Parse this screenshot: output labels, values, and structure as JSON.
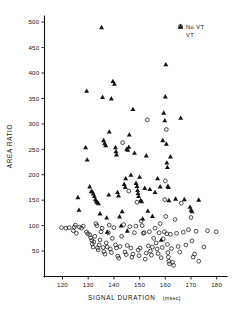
{
  "chart_data": {
    "type": "scatter",
    "title": "",
    "xlabel": "SIGNAL DURATION (msec)",
    "xlabel_main": "SIGNAL DURATION",
    "xlabel_unit": "(msec)",
    "ylabel": "AREA RATIO",
    "xlim": [
      113,
      184
    ],
    "ylim": [
      0,
      512
    ],
    "xticks": [
      120,
      130,
      140,
      150,
      160,
      170,
      180
    ],
    "yticks": [
      50,
      100,
      150,
      200,
      250,
      300,
      350,
      400,
      450,
      500
    ],
    "grid": false,
    "legend_position": "top-right",
    "colors": {
      "marker": "#141414",
      "axis": "#101010",
      "background": "#ffffff"
    },
    "series": [
      {
        "name": "No VT",
        "marker": "open-circle",
        "points": [
          [
            119.6,
            96
          ],
          [
            121.3,
            95
          ],
          [
            122.6,
            96
          ],
          [
            124.2,
            90
          ],
          [
            124.6,
            97
          ],
          [
            125.0,
            101
          ],
          [
            125.4,
            85
          ],
          [
            126.6,
            97
          ],
          [
            127.4,
            95
          ],
          [
            128.1,
            99
          ],
          [
            129.3,
            88
          ],
          [
            129.8,
            84
          ],
          [
            130.6,
            82
          ],
          [
            131.0,
            76
          ],
          [
            131.4,
            71
          ],
          [
            131.6,
            64
          ],
          [
            131.9,
            58
          ],
          [
            132.2,
            68
          ],
          [
            132.6,
            79
          ],
          [
            133.0,
            104
          ],
          [
            133.4,
            100
          ],
          [
            133.6,
            56
          ],
          [
            133.9,
            52
          ],
          [
            134.3,
            62
          ],
          [
            134.6,
            72
          ],
          [
            135.0,
            88
          ],
          [
            135.4,
            95
          ],
          [
            135.8,
            57
          ],
          [
            136.1,
            49
          ],
          [
            136.5,
            44
          ],
          [
            137.0,
            66
          ],
          [
            137.4,
            58
          ],
          [
            137.8,
            86
          ],
          [
            138.2,
            101
          ],
          [
            138.6,
            54
          ],
          [
            139.0,
            47
          ],
          [
            139.4,
            75
          ],
          [
            140.0,
            96
          ],
          [
            140.6,
            62
          ],
          [
            141.0,
            56
          ],
          [
            141.5,
            40
          ],
          [
            141.9,
            36
          ],
          [
            142.4,
            59
          ],
          [
            143.0,
            79
          ],
          [
            143.4,
            263
          ],
          [
            143.8,
            102
          ],
          [
            144.3,
            48
          ],
          [
            144.8,
            43
          ],
          [
            145.2,
            61
          ],
          [
            145.8,
            168
          ],
          [
            146.2,
            98
          ],
          [
            146.6,
            56
          ],
          [
            147.0,
            38
          ],
          [
            147.4,
            44
          ],
          [
            148.0,
            86
          ],
          [
            148.5,
            99
          ],
          [
            149.0,
            146
          ],
          [
            149.4,
            52
          ],
          [
            149.8,
            41
          ],
          [
            150.2,
            56
          ],
          [
            150.6,
            109
          ],
          [
            151.0,
            100
          ],
          [
            151.4,
            85
          ],
          [
            151.8,
            86
          ],
          [
            152.2,
            34
          ],
          [
            152.6,
            46
          ],
          [
            153.0,
            308
          ],
          [
            153.4,
            60
          ],
          [
            153.8,
            88
          ],
          [
            154.2,
            50
          ],
          [
            154.6,
            42
          ],
          [
            155.0,
            58
          ],
          [
            155.5,
            75
          ],
          [
            156.0,
            95
          ],
          [
            156.4,
            66
          ],
          [
            156.8,
            54
          ],
          [
            157.2,
            45
          ],
          [
            157.6,
            86
          ],
          [
            158.0,
            104
          ],
          [
            158.4,
            37
          ],
          [
            158.8,
            57
          ],
          [
            159.2,
            74
          ],
          [
            159.6,
            88
          ],
          [
            159.8,
            151
          ],
          [
            160.0,
            188
          ],
          [
            160.2,
            118
          ],
          [
            160.4,
            289
          ],
          [
            160.6,
            84
          ],
          [
            160.8,
            63
          ],
          [
            161.0,
            47
          ],
          [
            161.2,
            38
          ],
          [
            161.4,
            30
          ],
          [
            161.6,
            25
          ],
          [
            162.0,
            83
          ],
          [
            162.4,
            55
          ],
          [
            162.8,
            28
          ],
          [
            163.2,
            22
          ],
          [
            163.8,
            112
          ],
          [
            164.4,
            85
          ],
          [
            165.0,
            59
          ],
          [
            165.6,
            48
          ],
          [
            166.2,
            144
          ],
          [
            167.0,
            87
          ],
          [
            168.0,
            62
          ],
          [
            169.0,
            92
          ],
          [
            170.0,
            116
          ],
          [
            170.4,
            70
          ],
          [
            170.8,
            38
          ],
          [
            171.4,
            44
          ],
          [
            172.0,
            89
          ],
          [
            173.0,
            30
          ],
          [
            175.0,
            58
          ],
          [
            176.4,
            90
          ],
          [
            179.8,
            88
          ]
        ]
      },
      {
        "name": "VT",
        "marker": "filled-triangle",
        "points": [
          [
            126.0,
            156
          ],
          [
            126.4,
            131
          ],
          [
            129.4,
            365
          ],
          [
            129.0,
            254
          ],
          [
            129.6,
            230
          ],
          [
            130.6,
            177
          ],
          [
            131.2,
            168
          ],
          [
            131.6,
            167
          ],
          [
            132.0,
            163
          ],
          [
            132.4,
            158
          ],
          [
            132.8,
            152
          ],
          [
            133.2,
            148
          ],
          [
            133.6,
            146
          ],
          [
            134.0,
            144
          ],
          [
            134.6,
            124
          ],
          [
            135.2,
            490
          ],
          [
            135.6,
            353
          ],
          [
            136.0,
            268
          ],
          [
            136.4,
            262
          ],
          [
            136.8,
            258
          ],
          [
            137.2,
            116
          ],
          [
            138.0,
            161
          ],
          [
            138.2,
            285
          ],
          [
            139.0,
            350
          ],
          [
            139.6,
            384
          ],
          [
            140.2,
            379
          ],
          [
            140.6,
            254
          ],
          [
            140.8,
            246
          ],
          [
            141.0,
            240
          ],
          [
            141.4,
            166
          ],
          [
            141.8,
            159
          ],
          [
            142.2,
            118
          ],
          [
            142.8,
            100
          ],
          [
            143.2,
            128
          ],
          [
            144.0,
            182
          ],
          [
            144.4,
            176
          ],
          [
            144.6,
            193
          ],
          [
            145.0,
            251
          ],
          [
            145.4,
            249
          ],
          [
            145.8,
            255
          ],
          [
            146.0,
            279
          ],
          [
            146.6,
            200
          ],
          [
            147.4,
            329
          ],
          [
            148.0,
            243
          ],
          [
            148.6,
            184
          ],
          [
            149.0,
            178
          ],
          [
            149.2,
            170
          ],
          [
            149.4,
            164
          ],
          [
            149.6,
            158
          ],
          [
            150.0,
            196
          ],
          [
            150.4,
            150
          ],
          [
            150.8,
            148
          ],
          [
            151.2,
            114
          ],
          [
            152.0,
            174
          ],
          [
            152.6,
            238
          ],
          [
            153.2,
            129
          ],
          [
            154.0,
            172
          ],
          [
            155.0,
            119
          ],
          [
            156.0,
            166
          ],
          [
            157.0,
            193
          ],
          [
            158.0,
            177
          ],
          [
            159.0,
            268
          ],
          [
            159.4,
            322
          ],
          [
            159.8,
            307
          ],
          [
            160.0,
            354
          ],
          [
            160.2,
            417
          ],
          [
            160.4,
            261
          ],
          [
            160.6,
            224
          ],
          [
            160.8,
            215
          ],
          [
            161.0,
            178
          ],
          [
            161.2,
            176
          ],
          [
            161.4,
            150
          ],
          [
            162.0,
            236
          ],
          [
            164.0,
            153
          ],
          [
            166.0,
            312
          ],
          [
            167.4,
            152
          ],
          [
            169.6,
            137
          ],
          [
            170.0,
            131
          ],
          [
            170.4,
            128
          ],
          [
            173.0,
            151
          ],
          [
            137.4,
            88
          ],
          [
            145.2,
            90
          ],
          [
            158.4,
            72
          ]
        ]
      }
    ]
  },
  "legend": {
    "entries": [
      {
        "label": "No VT",
        "marker": "open-circle"
      },
      {
        "label": "VT",
        "marker": "filled-triangle"
      }
    ]
  },
  "axes": {
    "x": {
      "title": "SIGNAL DURATION",
      "unit": "(msec)",
      "tick_labels": [
        "120",
        "130",
        "140",
        "150",
        "160",
        "170",
        "180"
      ]
    },
    "y": {
      "title": "AREA RATIO",
      "tick_labels": [
        "50",
        "100",
        "150",
        "200",
        "250",
        "300",
        "350",
        "400",
        "450",
        "500"
      ]
    }
  }
}
